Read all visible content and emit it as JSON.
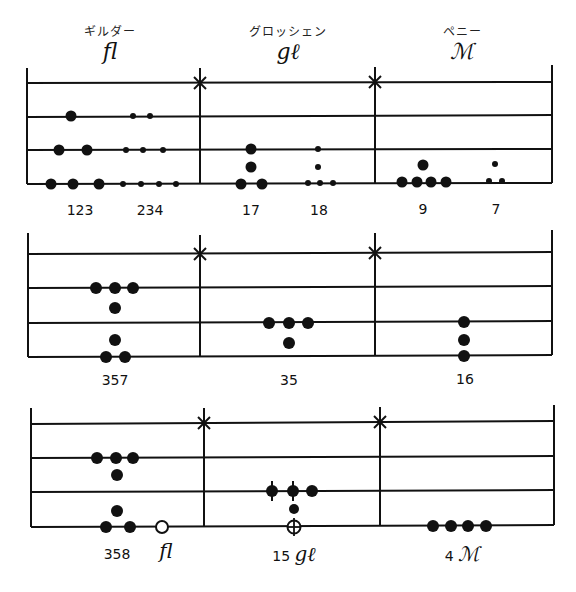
{
  "columns": [
    {
      "name": "ギルダー",
      "symbol": "fl"
    },
    {
      "name": "グロッシェン",
      "symbol": "gℓ"
    },
    {
      "name": "ペニー",
      "symbol": "ℳ"
    }
  ],
  "boards": [
    {
      "id": 1,
      "labels": [
        {
          "text": "123",
          "x": 80
        },
        {
          "text": "234",
          "x": 150
        },
        {
          "text": "17",
          "x": 251
        },
        {
          "text": "18",
          "x": 319
        },
        {
          "text": "9",
          "x": 423
        },
        {
          "text": "7",
          "x": 496
        }
      ],
      "counters_description": "Left value 123 fl with large counters; 234 with small counters; 17 and 18 gℓ; 9 and 7 pennies"
    },
    {
      "id": 2,
      "labels": [
        {
          "text": "357",
          "x": 115
        },
        {
          "text": "35",
          "x": 289
        },
        {
          "text": "16",
          "x": 465
        }
      ]
    },
    {
      "id": 3,
      "labels": [
        {
          "text": "358",
          "x": 117,
          "unit": ""
        },
        {
          "text": "",
          "x": 166,
          "unit": "fl"
        },
        {
          "text": "15",
          "x": 294,
          "unit": "gℓ"
        },
        {
          "text": "4",
          "x": 462,
          "unit": "ℳ"
        }
      ]
    }
  ],
  "colors": {
    "ink": "#111111",
    "background": "#ffffff"
  }
}
